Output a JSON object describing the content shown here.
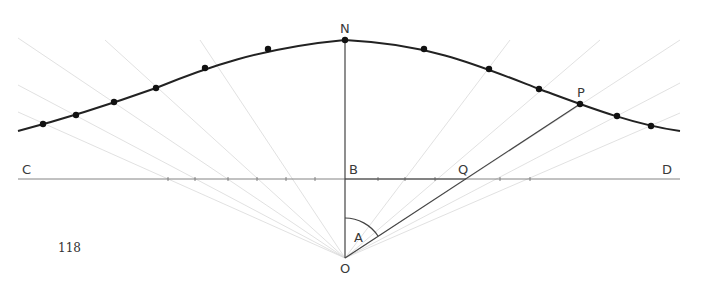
{
  "figure": {
    "page_number": "118",
    "labels": {
      "N": "N",
      "P": "P",
      "C": "C",
      "B": "B",
      "Q": "Q",
      "D": "D",
      "A": "A",
      "O": "O"
    },
    "points": {
      "N": [
        345,
        40
      ],
      "B": [
        345,
        179
      ],
      "O": [
        345,
        258
      ],
      "Q": [
        466,
        179
      ],
      "P": [
        580,
        104
      ],
      "C_end": [
        18,
        179
      ],
      "D_end": [
        680,
        179
      ]
    },
    "curve_dots": [
      [
        43,
        124
      ],
      [
        76,
        115
      ],
      [
        114,
        102
      ],
      [
        156,
        88
      ],
      [
        205,
        68
      ],
      [
        268,
        49
      ],
      [
        345,
        40
      ],
      [
        424,
        49
      ],
      [
        489,
        69
      ],
      [
        539,
        89
      ],
      [
        580,
        104
      ],
      [
        617,
        116
      ],
      [
        651,
        126
      ]
    ],
    "colors": {
      "curve": "#222222",
      "construction_lines": "#d9d9d9",
      "main_lines": "#444444",
      "background": "#ffffff"
    }
  }
}
